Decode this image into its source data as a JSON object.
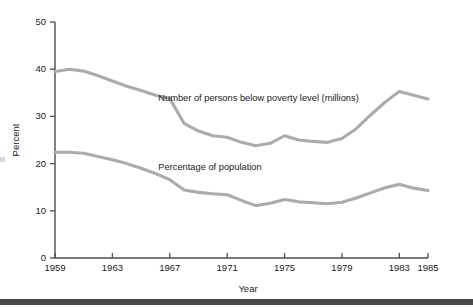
{
  "chart_data": {
    "type": "line",
    "title": "",
    "subtitle": "",
    "xlabel": "Year",
    "ylabel": "Percent",
    "xlim": [
      1959,
      1985
    ],
    "ylim": [
      0,
      50
    ],
    "grid": false,
    "legend_position": "inline-annotation",
    "xticks": [
      1959,
      1963,
      1967,
      1971,
      1975,
      1979,
      1983,
      1985
    ],
    "xtick_labels": [
      "1959",
      "1963",
      "1967",
      "1971",
      "1975",
      "1979",
      "1983",
      "1985"
    ],
    "yticks": [
      0,
      10,
      20,
      30,
      40,
      50
    ],
    "ytick_labels": [
      "0",
      "10",
      "20",
      "30",
      "40",
      "50"
    ],
    "line_color": "#ababab",
    "axis_color": "#4d4d4d",
    "x": [
      1959,
      1960,
      1961,
      1962,
      1963,
      1964,
      1965,
      1966,
      1967,
      1968,
      1969,
      1970,
      1971,
      1972,
      1973,
      1974,
      1975,
      1976,
      1977,
      1978,
      1979,
      1980,
      1981,
      1982,
      1983,
      1984,
      1985
    ],
    "series": [
      {
        "name": "Number of persons below poverty level (millions)",
        "annotation": "Number of persons below poverty level (millions)",
        "annotation_x": 1966.2,
        "annotation_y": 33.2,
        "values": [
          39.5,
          40.0,
          39.6,
          38.6,
          37.5,
          36.4,
          35.5,
          34.5,
          33.8,
          28.5,
          26.9,
          25.9,
          25.6,
          24.5,
          23.8,
          24.3,
          25.9,
          25.0,
          24.7,
          24.5,
          25.3,
          27.4,
          30.3,
          33.0,
          35.3,
          34.5,
          33.7
        ]
      },
      {
        "name": "Percentage of population",
        "annotation": "Percentage of population",
        "annotation_x": 1966.2,
        "annotation_y": 18.6,
        "values": [
          22.4,
          22.4,
          22.2,
          21.5,
          20.8,
          20.0,
          19.0,
          17.9,
          16.6,
          14.4,
          13.9,
          13.6,
          13.4,
          12.2,
          11.1,
          11.6,
          12.4,
          11.9,
          11.7,
          11.5,
          11.8,
          12.7,
          13.8,
          14.9,
          15.6,
          14.8,
          14.3
        ]
      }
    ]
  },
  "decor": {
    "bottom_bar": "bottom-rule"
  }
}
